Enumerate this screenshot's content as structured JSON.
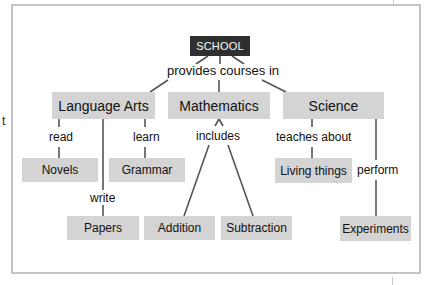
{
  "side_text": "t",
  "diagram": {
    "root": "SCHOOL",
    "root_link_label": "provides courses in",
    "subjects": [
      {
        "name": "Language Arts"
      },
      {
        "name": "Mathematics"
      },
      {
        "name": "Science"
      }
    ],
    "leaves": {
      "novels": "Novels",
      "grammar": "Grammar",
      "papers": "Papers",
      "addition": "Addition",
      "subtraction": "Subtraction",
      "living_things": "Living things",
      "experiments": "Experiments"
    },
    "link_labels": {
      "read": "read",
      "learn": "learn",
      "write": "write",
      "includes": "includes",
      "teaches_about": "teaches about",
      "perform": "perform"
    },
    "colors": {
      "root_fill": "#2f2f2f",
      "node_fill": "#d4d4d4",
      "line": "#555555",
      "frame": "#c4c4c4"
    }
  }
}
